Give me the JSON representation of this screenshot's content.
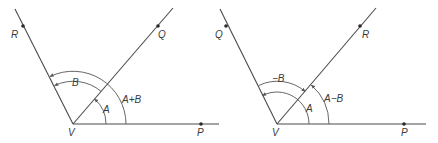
{
  "diagrams": [
    {
      "name": "angle-sum",
      "vertex": {
        "label": "V",
        "x": 73,
        "y": 124
      },
      "points": {
        "P": {
          "label": "P",
          "x": 201,
          "y": 124
        },
        "Q": {
          "label": "Q",
          "x": 158,
          "y": 26
        },
        "R": {
          "label": "R",
          "x": 23,
          "y": 26
        }
      },
      "angles": {
        "A": {
          "label": "A"
        },
        "B": {
          "label": "B"
        },
        "sum": {
          "label": "A+B"
        }
      }
    },
    {
      "name": "angle-difference",
      "vertex": {
        "label": "V",
        "x": 277,
        "y": 124
      },
      "points": {
        "P": {
          "label": "P",
          "x": 404,
          "y": 124
        },
        "R": {
          "label": "R",
          "x": 360,
          "y": 26
        },
        "Q": {
          "label": "Q",
          "x": 226,
          "y": 26
        }
      },
      "angles": {
        "A": {
          "label": "A"
        },
        "negB": {
          "label": "−B"
        },
        "diff": {
          "label": "A−B"
        }
      }
    }
  ],
  "colors": {
    "line": "#4a4a4a",
    "arc": "#555555",
    "dot": "#2a2a2a",
    "text": "#3a3a3a",
    "background": "#ffffff"
  }
}
